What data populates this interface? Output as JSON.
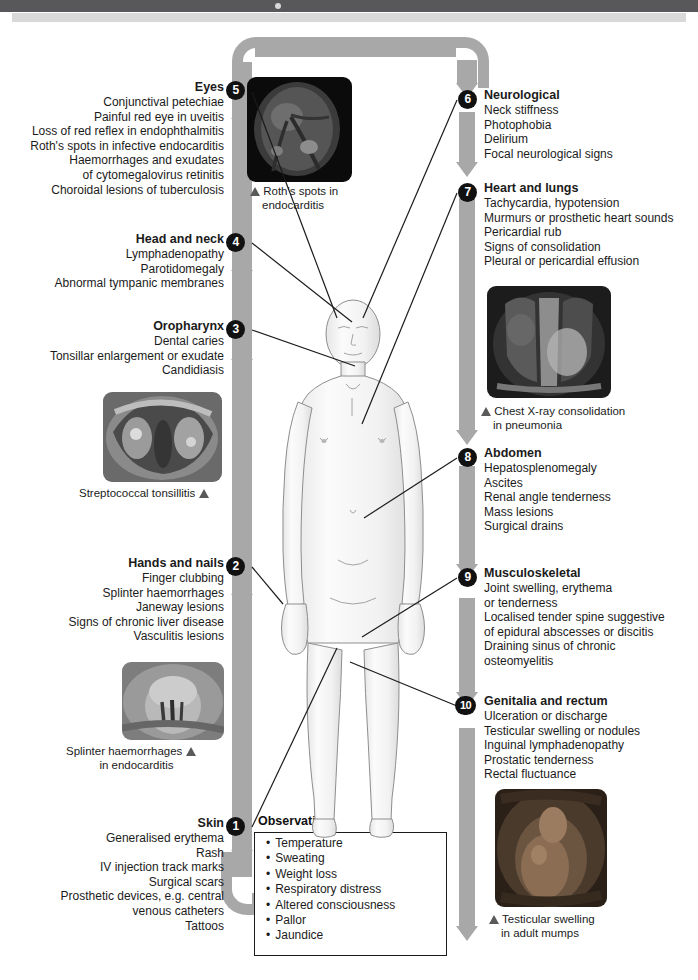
{
  "page": {
    "width": 698,
    "height": 980,
    "ribbon_color": "#a8a8a8",
    "bullet_color": "#111111",
    "text_color": "#1b1b1b"
  },
  "sections": [
    {
      "number": "1",
      "title": "Skin",
      "side": "left",
      "items": [
        "Generalised erythema",
        "Rash",
        "IV injection track marks",
        "Surgical scars",
        "Prosthetic devices, e.g. central",
        "venous catheters",
        "Tattoos"
      ]
    },
    {
      "number": "2",
      "title": "Hands and nails",
      "side": "left",
      "items": [
        "Finger clubbing",
        "Splinter haemorrhages",
        "Janeway lesions",
        "Signs of chronic liver disease",
        "Vasculitis lesions"
      ]
    },
    {
      "number": "3",
      "title": "Oropharynx",
      "side": "left",
      "items": [
        "Dental caries",
        "Tonsillar enlargement or exudate",
        "Candidiasis"
      ]
    },
    {
      "number": "4",
      "title": "Head and neck",
      "side": "left",
      "items": [
        "Lymphadenopathy",
        "Parotidomegaly",
        "Abnormal tympanic membranes"
      ]
    },
    {
      "number": "5",
      "title": "Eyes",
      "side": "left",
      "items": [
        "Conjunctival petechiae",
        "Painful red eye in uveitis",
        "Loss of red reflex in endophthalmitis",
        "Roth's spots in infective endocarditis",
        "Haemorrhages and exudates",
        "of cytomegalovirus retinitis",
        "Choroidal lesions of tuberculosis"
      ]
    },
    {
      "number": "6",
      "title": "Neurological",
      "side": "right",
      "items": [
        "Neck stiffness",
        "Photophobia",
        "Delirium",
        "Focal neurological signs"
      ]
    },
    {
      "number": "7",
      "title": "Heart and lungs",
      "side": "right",
      "items": [
        "Tachycardia, hypotension",
        "Murmurs or prosthetic heart sounds",
        "Pericardial rub",
        "Signs of consolidation",
        "Pleural or pericardial effusion"
      ]
    },
    {
      "number": "8",
      "title": "Abdomen",
      "side": "right",
      "items": [
        "Hepatosplenomegaly",
        "Ascites",
        "Renal angle tenderness",
        "Mass lesions",
        "Surgical drains"
      ]
    },
    {
      "number": "9",
      "title": "Musculoskeletal",
      "side": "right",
      "items": [
        "Joint swelling, erythema",
        "or tenderness",
        "Localised tender spine suggestive",
        "of epidural abscesses or discitis",
        "Draining sinus of chronic",
        "osteomyelitis"
      ]
    },
    {
      "number": "10",
      "title": "Genitalia and rectum",
      "side": "right",
      "items": [
        "Ulceration or discharge",
        "Testicular swelling or nodules",
        "Inguinal lymphadenopathy",
        "Prostatic tenderness",
        "Rectal fluctuance"
      ]
    }
  ],
  "photos": [
    {
      "id": "roths-spots",
      "caption_lines": [
        "Roth's spots in",
        "endocarditis"
      ],
      "marker_side": "left",
      "subject": "retinal fundus photograph"
    },
    {
      "id": "streptococcal-tonsillitis",
      "caption_lines": [
        "Streptococcal tonsillitis"
      ],
      "marker_side": "right",
      "subject": "oropharynx photograph"
    },
    {
      "id": "splinter-haemorrhages",
      "caption_lines": [
        "Splinter haemorrhages",
        "in endocarditis"
      ],
      "marker_side": "right",
      "subject": "fingernail photograph"
    },
    {
      "id": "chest-xray",
      "caption_lines": [
        "Chest X-ray consolidation",
        "in pneumonia"
      ],
      "marker_side": "left",
      "subject": "chest radiograph"
    },
    {
      "id": "testicular-swelling",
      "caption_lines": [
        "Testicular swelling",
        "in adult mumps"
      ],
      "marker_side": "left",
      "subject": "scrotal photograph"
    }
  ],
  "observation": {
    "title": "Observation",
    "items": [
      "Temperature",
      "Sweating",
      "Weight loss",
      "Respiratory distress",
      "Altered consciousness",
      "Pallor",
      "Jaundice"
    ]
  }
}
